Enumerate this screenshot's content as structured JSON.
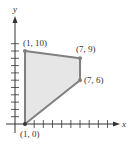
{
  "chart_data": {
    "type": "scatter",
    "title": "",
    "xlabel": "x",
    "ylabel": "y",
    "xlim": [
      0,
      12
    ],
    "ylim": [
      0,
      11
    ],
    "grid": false,
    "series": [
      {
        "name": "feasible region",
        "kind": "polygon",
        "points": [
          [
            1,
            0
          ],
          [
            1,
            10
          ],
          [
            7,
            9
          ],
          [
            7,
            6
          ]
        ]
      }
    ],
    "annotations": [
      {
        "text": "(1, 10)",
        "x": 1,
        "y": 10
      },
      {
        "text": "(7, 9)",
        "x": 7,
        "y": 9
      },
      {
        "text": "(7, 6)",
        "x": 7,
        "y": 6
      },
      {
        "text": "(1, 0)",
        "x": 1,
        "y": 0
      }
    ]
  },
  "colors": {
    "fill": "#e6e6e6",
    "edge": "#808080",
    "axis": "#333333"
  }
}
